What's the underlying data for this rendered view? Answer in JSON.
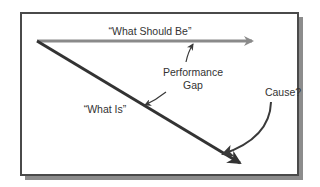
{
  "diagram": {
    "labels": {
      "what_should_be": "“What Should Be”",
      "performance": "Performance",
      "gap": "Gap",
      "what_is": "“What Is”",
      "cause": "Cause?"
    },
    "colors": {
      "frame": "#4a4a4a",
      "shadow": "#8c8c8c",
      "should_be_arrow": "#8a8a8a",
      "what_is_arrow": "#333333",
      "annotation_arrow": "#3a3a3a",
      "text": "#333333"
    },
    "nodes": [
      {
        "id": "what-should-be",
        "label_key": "what_should_be"
      },
      {
        "id": "what-is",
        "label_key": "what_is"
      },
      {
        "id": "performance-gap",
        "label_key": "performance"
      },
      {
        "id": "cause",
        "label_key": "cause"
      }
    ],
    "edges": [
      {
        "from": "origin",
        "to": "what-should-be",
        "style": "gray-arrow"
      },
      {
        "from": "origin",
        "to": "what-is",
        "style": "dark-arrow"
      },
      {
        "from": "performance-gap",
        "to": "what-should-be",
        "style": "thin-arrow"
      },
      {
        "from": "performance-gap",
        "to": "what-is",
        "style": "thin-arrow"
      },
      {
        "from": "cause",
        "to": "what-is",
        "style": "curved-arrow"
      }
    ]
  }
}
